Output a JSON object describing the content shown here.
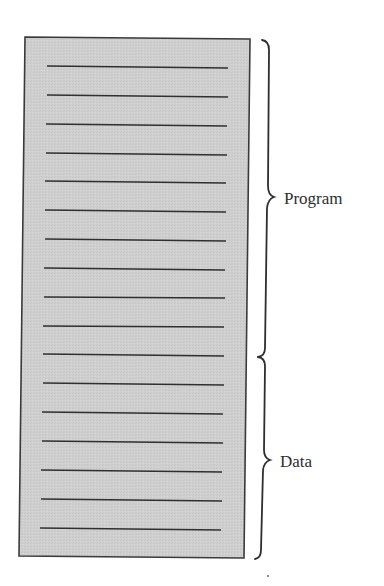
{
  "figure": {
    "box": {
      "fill_color": "#cfcfcf",
      "border_color": "#3a3a3a",
      "line_color": "#2f2f2f",
      "line_count": 17
    },
    "regions": [
      {
        "label": "Program",
        "lines": 11
      },
      {
        "label": "Data",
        "lines": 6
      }
    ]
  }
}
